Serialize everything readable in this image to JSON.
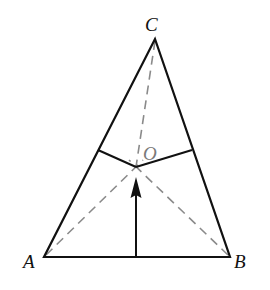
{
  "diagram": {
    "type": "geometry",
    "shape": "triangle",
    "colors": {
      "background": "#ffffff",
      "solid_stroke": "#111111",
      "dashed_stroke": "#8a8a8a",
      "center_label": "#7a7a7a"
    },
    "vertices": {
      "A": {
        "label": "A",
        "x": 44,
        "y": 257
      },
      "B": {
        "label": "B",
        "x": 230,
        "y": 257
      },
      "C": {
        "label": "C",
        "x": 155,
        "y": 39
      }
    },
    "center": {
      "label": "O",
      "x": 136,
      "y": 167
    },
    "side_points": {
      "on_AC": {
        "x": 98,
        "y": 150
      },
      "on_BC": {
        "x": 192,
        "y": 150
      }
    },
    "arrow": {
      "from": {
        "x": 136,
        "y": 257
      },
      "to": {
        "x": 136,
        "y": 177
      }
    },
    "solid_segments": [
      "A-B",
      "B-C",
      "C-A",
      "O-on_AC",
      "O-on_BC"
    ],
    "dashed_segments": [
      "A-O-extended",
      "B-O-extended",
      "C-O"
    ],
    "labels": [
      {
        "id": "A",
        "text": "A"
      },
      {
        "id": "B",
        "text": "B"
      },
      {
        "id": "C",
        "text": "C"
      },
      {
        "id": "O",
        "text": "O"
      }
    ]
  }
}
